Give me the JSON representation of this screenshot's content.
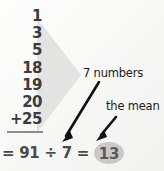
{
  "figure": {
    "name": "mean-calculation-diagram",
    "background_color": "#f8f8f6",
    "bracket": {
      "shape": "triangle",
      "color": "#e2e2e0"
    }
  },
  "addition": {
    "addends": [
      "1",
      "3",
      "5",
      "18",
      "19",
      "20",
      "+25"
    ],
    "rule_color": "#8d8d8d"
  },
  "total": {
    "equals_1": "=",
    "sum": "91",
    "divide_sign": "÷",
    "divisor": "7",
    "equals_2": "=",
    "mean": "13",
    "mean_highlight_color": "#c9c9c9",
    "text_color": "#4a4a4a"
  },
  "callouts": [
    {
      "id": "count",
      "label": "7 numbers",
      "arrow": "arrow-to-divisor"
    },
    {
      "id": "mean",
      "label": "the mean",
      "arrow": "arrow-to-mean"
    }
  ],
  "arrows": {
    "color": "#111111"
  }
}
